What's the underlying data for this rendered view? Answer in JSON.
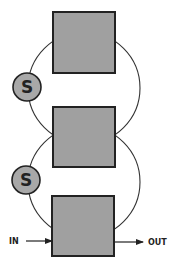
{
  "diagram": {
    "type": "stacked loop diagram",
    "colors": {
      "box_fill": "#a0a0a0",
      "stroke": "#222222",
      "background": "#ffffff",
      "node_fill": "#a8a8a8"
    },
    "boxes": [
      {
        "id": "box-top"
      },
      {
        "id": "box-middle"
      },
      {
        "id": "box-bottom"
      }
    ],
    "nodes": [
      {
        "id": "s-node-upper",
        "label": "S"
      },
      {
        "id": "s-node-lower",
        "label": "S"
      }
    ],
    "input": {
      "label": "IN"
    },
    "output": {
      "label": "OUT"
    }
  }
}
